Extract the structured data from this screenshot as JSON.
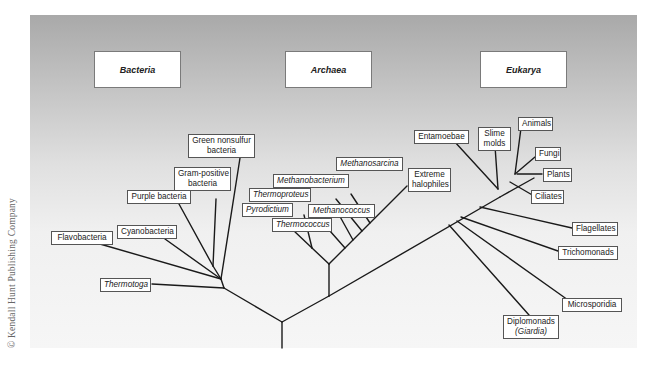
{
  "figure": {
    "type": "phylogenetic-tree",
    "copyright": "© Kendall Hunt Publishing Company",
    "domains": [
      {
        "name": "Bacteria"
      },
      {
        "name": "Archaea"
      },
      {
        "name": "Eukarya"
      }
    ],
    "bacteria": {
      "green_nonsulfur": {
        "line1": "Green nonsulfur",
        "line2": "bacteria"
      },
      "gram_positive": {
        "line1": "Gram-positive",
        "line2": "bacteria"
      },
      "purple": "Purple bacteria",
      "cyanobacteria": "Cyanobacteria",
      "flavobacteria": "Flavobacteria",
      "thermotoga": "Thermotoga"
    },
    "archaea": {
      "methanosarcina": "Methanosarcina",
      "methanobacterium": "Methanobacterium",
      "thermoproteus": "Thermoproteus",
      "pyrodictium": "Pyrodictium",
      "methanococcus": "Methanococcus",
      "thermococcus": "Thermococcus",
      "extreme_halophiles": {
        "line1": "Extreme",
        "line2": "halophiles"
      }
    },
    "eukarya": {
      "entamoebae": "Entamoebae",
      "slime_molds": {
        "line1": "Slime",
        "line2": "molds"
      },
      "animals": "Animals",
      "fungi": "Fungi",
      "plants": "Plants",
      "ciliates": "Ciliates",
      "flagellates": "Flagellates",
      "trichomonads": "Trichomonads",
      "microsporidia": "Microsporidia",
      "diplomonads": {
        "line1": "Diplomonads",
        "line2": "(Giardia)"
      }
    },
    "colors": {
      "line": "#1a1a1a",
      "panel_top": "#a9a9a9",
      "panel_bottom": "#f6f6f6",
      "box_fill": "#ffffff",
      "box_border": "#555555"
    }
  }
}
